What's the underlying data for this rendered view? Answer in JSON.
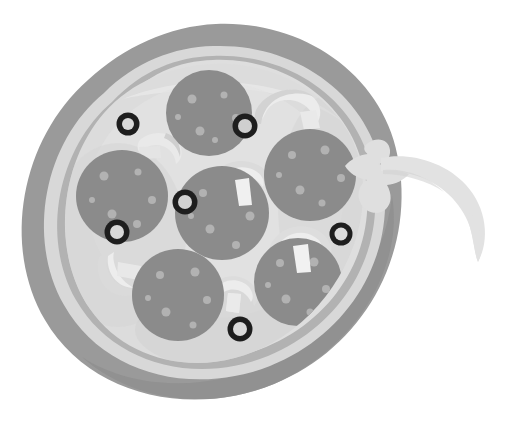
{
  "image": {
    "title": "Whole pepperoni pizza with cheese pull",
    "subject": "pizza",
    "style": "flat grayscale illustration",
    "background_color": "#ffffff",
    "width": 510,
    "height": 421
  },
  "palette": {
    "crust_outer": "#9a9a9a",
    "crust_shadow": "#8e8e8e",
    "crust_highlight": "#d6d6d6",
    "crust_mid": "#b4b4b4",
    "cheese_base": "#dcdcdc",
    "cheese_light": "#e4e4e4",
    "cheese_shade": "#cfcfcf",
    "pepperoni": "#8b8b8b",
    "pepperoni_speck": "#b0b0b0",
    "mushroom": "#e8e8e8",
    "mushroom_shade": "#cccccc",
    "olive_ring": "#1e1e1e",
    "olive_hole": "#d8d8d8",
    "cheese_pull": "#dfdfdf"
  },
  "pizza": {
    "label": "pizza-pie",
    "crust": {
      "label": "crust-ring",
      "center_x": 213,
      "center_y": 212,
      "radius_outer": 187,
      "radius_inner": 150
    },
    "cheese_surface": {
      "label": "cheese-surface",
      "center_x": 213,
      "center_y": 212,
      "radius": 148
    }
  },
  "toppings": {
    "pepperoni": {
      "label": "pepperoni-slice",
      "count": 6,
      "items": [
        {
          "id": "pepperoni-top",
          "cx": 209,
          "cy": 113,
          "r": 43
        },
        {
          "id": "pepperoni-right",
          "cx": 310,
          "cy": 175,
          "r": 46
        },
        {
          "id": "pepperoni-center",
          "cx": 222,
          "cy": 213,
          "r": 47
        },
        {
          "id": "pepperoni-left",
          "cx": 122,
          "cy": 196,
          "r": 46
        },
        {
          "id": "pepperoni-bottom-left",
          "cx": 178,
          "cy": 295,
          "r": 46
        },
        {
          "id": "pepperoni-bottom-right",
          "cx": 298,
          "cy": 282,
          "r": 44
        }
      ]
    },
    "olives": {
      "label": "black-olive-ring",
      "count": 6,
      "items": [
        {
          "id": "olive-upper-left",
          "cx": 128,
          "cy": 124,
          "r_outer": 11,
          "r_inner": 6
        },
        {
          "id": "olive-upper-right",
          "cx": 245,
          "cy": 126,
          "r_outer": 12,
          "r_inner": 7
        },
        {
          "id": "olive-left",
          "cx": 117,
          "cy": 232,
          "r_outer": 12,
          "r_inner": 7
        },
        {
          "id": "olive-center",
          "cx": 185,
          "cy": 202,
          "r_outer": 12,
          "r_inner": 7
        },
        {
          "id": "olive-right",
          "cx": 341,
          "cy": 234,
          "r_outer": 11,
          "r_inner": 6
        },
        {
          "id": "olive-bottom",
          "cx": 240,
          "cy": 329,
          "r_outer": 12,
          "r_inner": 7
        }
      ]
    },
    "mushrooms": {
      "label": "mushroom-slice",
      "count": 6,
      "items": [
        {
          "id": "mushroom-upper-right",
          "cx": 285,
          "cy": 116
        },
        {
          "id": "mushroom-upper-left",
          "cx": 159,
          "cy": 150
        },
        {
          "id": "mushroom-center-top",
          "cx": 236,
          "cy": 181
        },
        {
          "id": "mushroom-left-lower",
          "cx": 115,
          "cy": 271
        },
        {
          "id": "mushroom-right-lower",
          "cx": 300,
          "cy": 243
        },
        {
          "id": "mushroom-bottom-center",
          "cx": 234,
          "cy": 299
        }
      ]
    },
    "cheese_pull": {
      "label": "stretched-cheese-strand",
      "anchor_x": 360,
      "anchor_y": 160,
      "tip_x": 478,
      "tip_y": 255
    }
  }
}
